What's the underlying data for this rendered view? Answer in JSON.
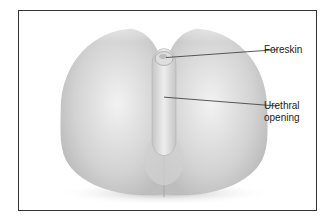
{
  "figure": {
    "type": "anatomical-illustration",
    "labels": [
      {
        "id": "foreskin",
        "lines": [
          "Foreskin"
        ]
      },
      {
        "id": "urethral-opening",
        "lines": [
          "Urethral",
          "opening"
        ]
      }
    ],
    "colors": {
      "border": "#333333",
      "leader_line": "#444444",
      "label_text": "#222222",
      "shading_dark": "#b5b5b5",
      "shading_light": "#f4f4f4"
    }
  }
}
